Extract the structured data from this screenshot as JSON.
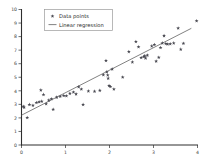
{
  "chart_data": {
    "type": "scatter",
    "title": "",
    "xlabel": "",
    "ylabel": "",
    "xlim": [
      0,
      4
    ],
    "ylim": [
      0,
      10
    ],
    "xticks": [
      0,
      1,
      2,
      3,
      4
    ],
    "yticks": [
      0,
      1,
      2,
      3,
      4,
      5,
      6,
      7,
      8,
      9,
      10
    ],
    "xtick_labels": [
      "0",
      "1",
      "2",
      "3",
      "4"
    ],
    "ytick_labels": [
      "0",
      "1",
      "2",
      "3",
      "4",
      "5",
      "6",
      "7",
      "8",
      "9",
      "10"
    ],
    "grid": false,
    "legend_position": "upper left",
    "marker_color": "#4a4a52",
    "line_color": "#6b6b6b",
    "axis_color": "#2e2e2e",
    "series": [
      {
        "name": "Data points",
        "type": "scatter",
        "marker": "star",
        "points": [
          [
            0.04,
            2.85
          ],
          [
            0.06,
            2.78
          ],
          [
            0.13,
            2.02
          ],
          [
            0.18,
            2.98
          ],
          [
            0.26,
            2.92
          ],
          [
            0.34,
            3.12
          ],
          [
            0.4,
            3.18
          ],
          [
            0.44,
            4.05
          ],
          [
            0.46,
            3.22
          ],
          [
            0.5,
            3.72
          ],
          [
            0.56,
            3.04
          ],
          [
            0.62,
            3.3
          ],
          [
            0.68,
            3.4
          ],
          [
            0.72,
            2.62
          ],
          [
            0.8,
            3.52
          ],
          [
            0.88,
            3.58
          ],
          [
            0.96,
            3.64
          ],
          [
            1.02,
            3.62
          ],
          [
            1.1,
            3.8
          ],
          [
            1.18,
            3.9
          ],
          [
            1.24,
            3.76
          ],
          [
            1.3,
            4.28
          ],
          [
            1.36,
            4.12
          ],
          [
            1.4,
            2.98
          ],
          [
            1.52,
            3.98
          ],
          [
            1.66,
            3.96
          ],
          [
            1.78,
            4.02
          ],
          [
            1.86,
            5.18
          ],
          [
            1.92,
            6.22
          ],
          [
            1.94,
            5.4
          ],
          [
            1.96,
            5.16
          ],
          [
            1.97,
            4.92
          ],
          [
            1.99,
            4.38
          ],
          [
            2.02,
            4.3
          ],
          [
            2.06,
            5.6
          ],
          [
            2.1,
            4.12
          ],
          [
            2.3,
            5.0
          ],
          [
            2.44,
            6.88
          ],
          [
            2.52,
            6.12
          ],
          [
            2.6,
            7.62
          ],
          [
            2.66,
            7.24
          ],
          [
            2.72,
            6.44
          ],
          [
            2.78,
            6.52
          ],
          [
            2.8,
            6.58
          ],
          [
            2.82,
            6.4
          ],
          [
            2.86,
            6.62
          ],
          [
            2.96,
            7.3
          ],
          [
            3.02,
            7.4
          ],
          [
            3.06,
            6.18
          ],
          [
            3.12,
            6.46
          ],
          [
            3.16,
            7.18
          ],
          [
            3.2,
            7.52
          ],
          [
            3.24,
            8.06
          ],
          [
            3.28,
            7.48
          ],
          [
            3.32,
            7.44
          ],
          [
            3.38,
            7.46
          ],
          [
            3.46,
            7.52
          ],
          [
            3.56,
            8.62
          ],
          [
            3.62,
            7.06
          ],
          [
            3.68,
            7.5
          ],
          [
            3.98,
            9.16
          ]
        ]
      },
      {
        "name": "Linear regression",
        "type": "line",
        "slope": 1.66,
        "intercept": 2.2,
        "endpoints": [
          [
            0.0,
            2.2
          ],
          [
            3.86,
            8.61
          ]
        ]
      }
    ]
  },
  "legend": {
    "entries": [
      {
        "label": "Data points",
        "symbol": "marker"
      },
      {
        "label": "Linear regression",
        "symbol": "line"
      }
    ]
  }
}
